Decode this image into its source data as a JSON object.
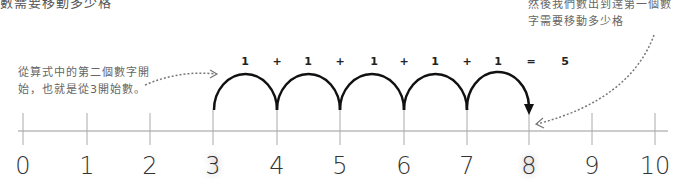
{
  "top_text": "數需要移動多少格",
  "notes": {
    "left_line1": "從算式中的第二個數字開",
    "left_line2": "始，也就是從3開始數。",
    "right_line1": "然後我們數出到達第一個數",
    "right_line2": "字需要移動多少格"
  },
  "equation": [
    "1",
    "+",
    "1",
    "+",
    "1",
    "+",
    "1",
    "+",
    "1",
    "=",
    "5"
  ],
  "number_line": {
    "labels": [
      "0",
      "1",
      "2",
      "3",
      "4",
      "5",
      "6",
      "7",
      "8",
      "9",
      "10"
    ],
    "start": "3",
    "end": "8",
    "jumps": 5
  }
}
